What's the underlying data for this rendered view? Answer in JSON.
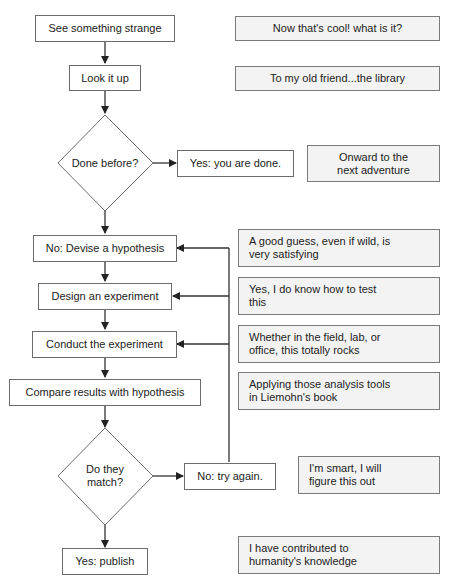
{
  "flow": {
    "steps": [
      {
        "id": "see",
        "label": "See something strange"
      },
      {
        "id": "lookup",
        "label": "Look it up"
      },
      {
        "id": "done_before",
        "label": "Done before?",
        "type": "decision"
      },
      {
        "id": "yes_done",
        "label": "Yes: you are done."
      },
      {
        "id": "hypothesis",
        "label": "No: Devise a hypothesis"
      },
      {
        "id": "design",
        "label": "Design an experiment"
      },
      {
        "id": "conduct",
        "label": "Conduct the experiment"
      },
      {
        "id": "compare",
        "label": "Compare results with hypothesis"
      },
      {
        "id": "match",
        "label_line1": "Do they",
        "label_line2": "match?",
        "type": "decision"
      },
      {
        "id": "try_again",
        "label": "No: try again."
      },
      {
        "id": "publish",
        "label": "Yes: publish"
      }
    ]
  },
  "notes": [
    {
      "for": "see",
      "text": "Now that's cool! what is it?"
    },
    {
      "for": "lookup",
      "text": "To my old friend...the library"
    },
    {
      "for": "yes_done",
      "line1": "Onward to the",
      "line2": "next adventure"
    },
    {
      "for": "hypothesis",
      "line1": "A good guess, even if wild, is",
      "line2": "very satisfying"
    },
    {
      "for": "design",
      "line1": "Yes, I do know how to test",
      "line2": "this"
    },
    {
      "for": "conduct",
      "line1": "Whether in the field, lab, or",
      "line2": "office, this totally rocks"
    },
    {
      "for": "compare",
      "line1": "Applying those analysis tools",
      "line2": "in Liemohn's book"
    },
    {
      "for": "try_again",
      "line1": "I'm smart, I will",
      "line2": "figure this out"
    },
    {
      "for": "publish",
      "line1": "I have contributed to",
      "line2": "humanity's knowledge"
    }
  ],
  "colors": {
    "line": "#333333",
    "box_border": "#6b6b6b",
    "note_fill": "#f3f3f3"
  }
}
